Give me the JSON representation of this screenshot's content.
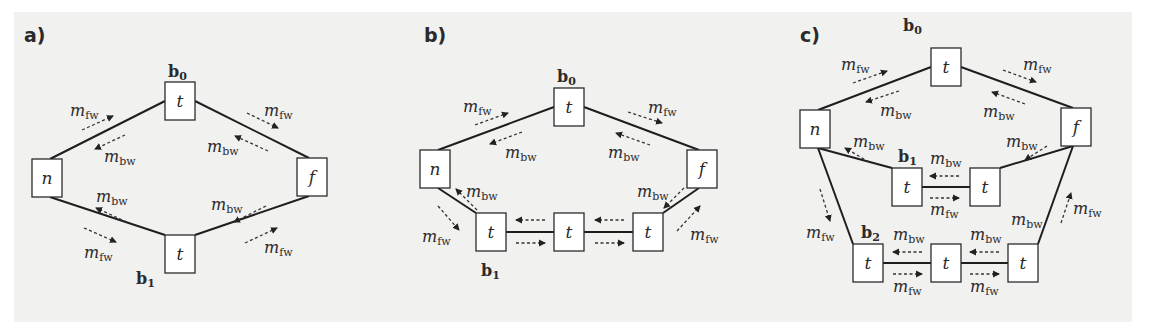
{
  "panels": [
    {
      "label": "a)",
      "label_pos": [
        24,
        42
      ],
      "nodes": [
        {
          "id": "n",
          "text": "n",
          "x": 32,
          "y": 159
        },
        {
          "id": "t0",
          "text": "t",
          "x": 165,
          "y": 82
        },
        {
          "id": "f",
          "text": "f",
          "x": 297,
          "y": 158
        },
        {
          "id": "t1",
          "text": "t",
          "x": 165,
          "y": 235
        }
      ],
      "edges": [
        [
          "n",
          "t0"
        ],
        [
          "t0",
          "f"
        ],
        [
          "n",
          "t1"
        ],
        [
          "t1",
          "f"
        ]
      ],
      "branch_labels": [
        {
          "text": "b",
          "sub": "0",
          "x": 168,
          "y": 77
        },
        {
          "text": "b",
          "sub": "1",
          "x": 136,
          "y": 284
        }
      ],
      "messages": [
        {
          "x1": 82,
          "y1": 130,
          "x2": 113,
          "y2": 116,
          "label": "fw",
          "lx": 70,
          "ly": 116
        },
        {
          "x1": 125,
          "y1": 135,
          "x2": 95,
          "y2": 149,
          "label": "bw",
          "lx": 104,
          "ly": 162
        },
        {
          "x1": 247,
          "y1": 113,
          "x2": 278,
          "y2": 128,
          "label": "fw",
          "lx": 264,
          "ly": 116
        },
        {
          "x1": 268,
          "y1": 151,
          "x2": 235,
          "y2": 136,
          "label": "bw",
          "lx": 207,
          "ly": 152
        },
        {
          "x1": 127,
          "y1": 222,
          "x2": 96,
          "y2": 208,
          "label": "bw",
          "lx": 96,
          "ly": 202
        },
        {
          "x1": 84,
          "y1": 228,
          "x2": 116,
          "y2": 242,
          "label": "fw",
          "lx": 84,
          "ly": 258
        },
        {
          "x1": 266,
          "y1": 206,
          "x2": 234,
          "y2": 222,
          "label": "bw",
          "lx": 211,
          "ly": 210
        },
        {
          "x1": 245,
          "y1": 243,
          "x2": 277,
          "y2": 228,
          "label": "fw",
          "lx": 264,
          "ly": 253
        }
      ],
      "message_label": "m"
    },
    {
      "label": "b)",
      "label_pos": [
        424,
        42
      ],
      "nodes": [
        {
          "id": "n",
          "text": "n",
          "x": 420,
          "y": 150
        },
        {
          "id": "t0",
          "text": "t",
          "x": 554,
          "y": 88
        },
        {
          "id": "f",
          "text": "f",
          "x": 687,
          "y": 150
        },
        {
          "id": "t1",
          "text": "t",
          "x": 476,
          "y": 213
        },
        {
          "id": "t2",
          "text": "t",
          "x": 554,
          "y": 213
        },
        {
          "id": "t3",
          "text": "t",
          "x": 633,
          "y": 213
        }
      ],
      "edges": [
        [
          "n",
          "t0"
        ],
        [
          "t0",
          "f"
        ],
        [
          "n",
          "t1"
        ],
        [
          "t1",
          "t2"
        ],
        [
          "t2",
          "t3"
        ],
        [
          "t3",
          "f"
        ]
      ],
      "branch_labels": [
        {
          "text": "b",
          "sub": "0",
          "x": 557,
          "y": 82
        },
        {
          "text": "b",
          "sub": "1",
          "x": 481,
          "y": 276
        }
      ],
      "messages": [
        {
          "x1": 475,
          "y1": 125,
          "x2": 508,
          "y2": 113,
          "label": "fw",
          "lx": 463,
          "ly": 112
        },
        {
          "x1": 522,
          "y1": 132,
          "x2": 490,
          "y2": 144,
          "label": "bw",
          "lx": 505,
          "ly": 158
        },
        {
          "x1": 628,
          "y1": 112,
          "x2": 662,
          "y2": 123,
          "label": "fw",
          "lx": 648,
          "ly": 113
        },
        {
          "x1": 650,
          "y1": 145,
          "x2": 616,
          "y2": 133,
          "label": "bw",
          "lx": 608,
          "ly": 158
        },
        {
          "x1": 477,
          "y1": 210,
          "x2": 456,
          "y2": 189,
          "label": "bw",
          "lx": 466,
          "ly": 197
        },
        {
          "x1": 438,
          "y1": 206,
          "x2": 459,
          "y2": 230,
          "label": "fw",
          "lx": 422,
          "ly": 242
        },
        {
          "x1": 545,
          "y1": 220,
          "x2": 516,
          "y2": 220,
          "label": "",
          "lx": 0,
          "ly": 0
        },
        {
          "x1": 516,
          "y1": 243,
          "x2": 545,
          "y2": 243,
          "label": "",
          "lx": 0,
          "ly": 0
        },
        {
          "x1": 624,
          "y1": 220,
          "x2": 595,
          "y2": 220,
          "label": "",
          "lx": 0,
          "ly": 0
        },
        {
          "x1": 595,
          "y1": 243,
          "x2": 624,
          "y2": 243,
          "label": "",
          "lx": 0,
          "ly": 0
        },
        {
          "x1": 684,
          "y1": 188,
          "x2": 664,
          "y2": 208,
          "label": "bw",
          "lx": 637,
          "ly": 197
        },
        {
          "x1": 677,
          "y1": 231,
          "x2": 700,
          "y2": 206,
          "label": "fw",
          "lx": 690,
          "ly": 240
        }
      ],
      "message_label": "m"
    },
    {
      "label": "c)",
      "label_pos": [
        800,
        42
      ],
      "nodes": [
        {
          "id": "n",
          "text": "n",
          "x": 800,
          "y": 110
        },
        {
          "id": "t0",
          "text": "t",
          "x": 931,
          "y": 48
        },
        {
          "id": "f",
          "text": "f",
          "x": 1061,
          "y": 108
        },
        {
          "id": "t1a",
          "text": "t",
          "x": 892,
          "y": 168
        },
        {
          "id": "t1b",
          "text": "t",
          "x": 970,
          "y": 168
        },
        {
          "id": "t2a",
          "text": "t",
          "x": 853,
          "y": 244
        },
        {
          "id": "t2b",
          "text": "t",
          "x": 931,
          "y": 244
        },
        {
          "id": "t2c",
          "text": "t",
          "x": 1008,
          "y": 244
        }
      ],
      "edges": [
        [
          "n",
          "t0"
        ],
        [
          "t0",
          "f"
        ],
        [
          "n",
          "t1a"
        ],
        [
          "t1a",
          "t1b"
        ],
        [
          "t1b",
          "f"
        ],
        [
          "n",
          "t2a"
        ],
        [
          "t2a",
          "t2b"
        ],
        [
          "t2b",
          "t2c"
        ],
        [
          "t2c",
          "f"
        ]
      ],
      "branch_labels": [
        {
          "text": "b",
          "sub": "0",
          "x": 903,
          "y": 31
        },
        {
          "text": "b",
          "sub": "1",
          "x": 898,
          "y": 162
        },
        {
          "text": "b",
          "sub": "2",
          "x": 861,
          "y": 238
        }
      ],
      "messages": [
        {
          "x1": 853,
          "y1": 83,
          "x2": 887,
          "y2": 71,
          "label": "fw",
          "lx": 841,
          "ly": 70
        },
        {
          "x1": 899,
          "y1": 91,
          "x2": 866,
          "y2": 102,
          "label": "bw",
          "lx": 880,
          "ly": 116
        },
        {
          "x1": 1003,
          "y1": 70,
          "x2": 1036,
          "y2": 82,
          "label": "fw",
          "lx": 1023,
          "ly": 70
        },
        {
          "x1": 1025,
          "y1": 104,
          "x2": 992,
          "y2": 92,
          "label": "bw",
          "lx": 983,
          "ly": 117
        },
        {
          "x1": 869,
          "y1": 162,
          "x2": 845,
          "y2": 148,
          "label": "bw",
          "lx": 853,
          "ly": 147
        },
        {
          "x1": 820,
          "y1": 189,
          "x2": 830,
          "y2": 221,
          "label": "fw",
          "lx": 806,
          "ly": 238
        },
        {
          "x1": 959,
          "y1": 176,
          "x2": 930,
          "y2": 176,
          "label": "bw",
          "lx": 930,
          "ly": 164
        },
        {
          "x1": 930,
          "y1": 198,
          "x2": 959,
          "y2": 198,
          "label": "fw",
          "lx": 930,
          "ly": 215
        },
        {
          "x1": 1047,
          "y1": 146,
          "x2": 1025,
          "y2": 160,
          "label": "bw",
          "lx": 1006,
          "ly": 147
        },
        {
          "x1": 1061,
          "y1": 223,
          "x2": 1071,
          "y2": 193,
          "label": "fw",
          "lx": 1073,
          "ly": 214
        },
        {
          "x1": "none",
          "y1": 0,
          "x2": 0,
          "y2": 0,
          "label": "bw",
          "lx": 1011,
          "ly": 225
        },
        {
          "x1": 922,
          "y1": 252,
          "x2": 893,
          "y2": 252,
          "label": "bw",
          "lx": 893,
          "ly": 240
        },
        {
          "x1": 893,
          "y1": 274,
          "x2": 922,
          "y2": 274,
          "label": "fw",
          "lx": 893,
          "ly": 292
        },
        {
          "x1": 999,
          "y1": 252,
          "x2": 970,
          "y2": 252,
          "label": "bw",
          "lx": 970,
          "ly": 240
        },
        {
          "x1": 970,
          "y1": 274,
          "x2": 999,
          "y2": 274,
          "label": "fw",
          "lx": 970,
          "ly": 292
        }
      ],
      "message_label": "m"
    }
  ],
  "node_size": [
    30,
    38
  ],
  "colors": {
    "background": "#f1f1f0",
    "stroke": "#2b2b2b",
    "node_fill": "#ffffff"
  }
}
